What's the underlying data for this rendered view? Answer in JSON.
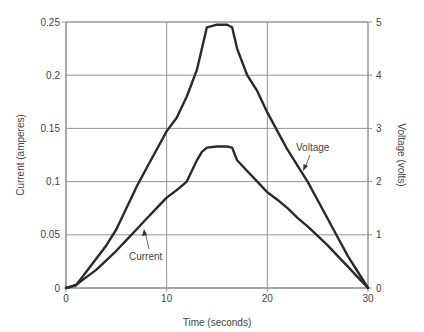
{
  "chart_data": {
    "type": "line",
    "title": "",
    "xlabel": "Time (seconds)",
    "ylabel": "Current (amperes)",
    "y2label": "Voltage (volts)",
    "xlim": [
      0,
      30
    ],
    "ylim": [
      0,
      0.25
    ],
    "y2lim": [
      0,
      5
    ],
    "grid": true,
    "legend": "none (inline annotations)",
    "x_ticks": [
      "0",
      "10",
      "20",
      "30"
    ],
    "y_ticks": [
      "0",
      "0.05",
      "0.1",
      "0.15",
      "0.2",
      "0.25"
    ],
    "y2_ticks": [
      "0",
      "1",
      "2",
      "3",
      "4",
      "5"
    ],
    "x": [
      0,
      1,
      2,
      3,
      4,
      5,
      6,
      7,
      8,
      9,
      10,
      11,
      12,
      13,
      13.5,
      14,
      15,
      16,
      16.5,
      17,
      18,
      19,
      20,
      21,
      22,
      23,
      24,
      25,
      26,
      27,
      28,
      29,
      29.5,
      30
    ],
    "series": [
      {
        "name": "Voltage",
        "axis": "right",
        "unit": "volts",
        "values": [
          0.0,
          0.05,
          0.3,
          0.55,
          0.8,
          1.1,
          1.5,
          1.9,
          2.25,
          2.6,
          2.95,
          3.2,
          3.6,
          4.1,
          4.5,
          4.9,
          4.95,
          4.95,
          4.9,
          4.5,
          4.0,
          3.7,
          3.3,
          2.95,
          2.6,
          2.3,
          2.0,
          1.65,
          1.3,
          0.95,
          0.6,
          0.3,
          0.15,
          0.0
        ]
      },
      {
        "name": "Current",
        "axis": "left",
        "unit": "amperes",
        "values": [
          0.0,
          0.003,
          0.01,
          0.017,
          0.026,
          0.035,
          0.045,
          0.055,
          0.065,
          0.075,
          0.085,
          0.092,
          0.1,
          0.12,
          0.128,
          0.132,
          0.133,
          0.133,
          0.132,
          0.12,
          0.11,
          0.1,
          0.09,
          0.083,
          0.075,
          0.066,
          0.058,
          0.049,
          0.04,
          0.03,
          0.02,
          0.01,
          0.005,
          0.0
        ]
      }
    ],
    "annotations": [
      {
        "text": "Voltage",
        "points_to": "Voltage"
      },
      {
        "text": "Current",
        "points_to": "Current"
      }
    ]
  },
  "labels": {
    "xlabel": "Time (seconds)",
    "ylabel": "Current (amperes)",
    "y2label": "Voltage (volts)",
    "annot_voltage": "Voltage",
    "annot_current": "Current"
  },
  "colors": {
    "line": "#2a2a2a",
    "grid": "#7a7a7a",
    "axis": "#9a9a9a",
    "text": "#444444"
  }
}
